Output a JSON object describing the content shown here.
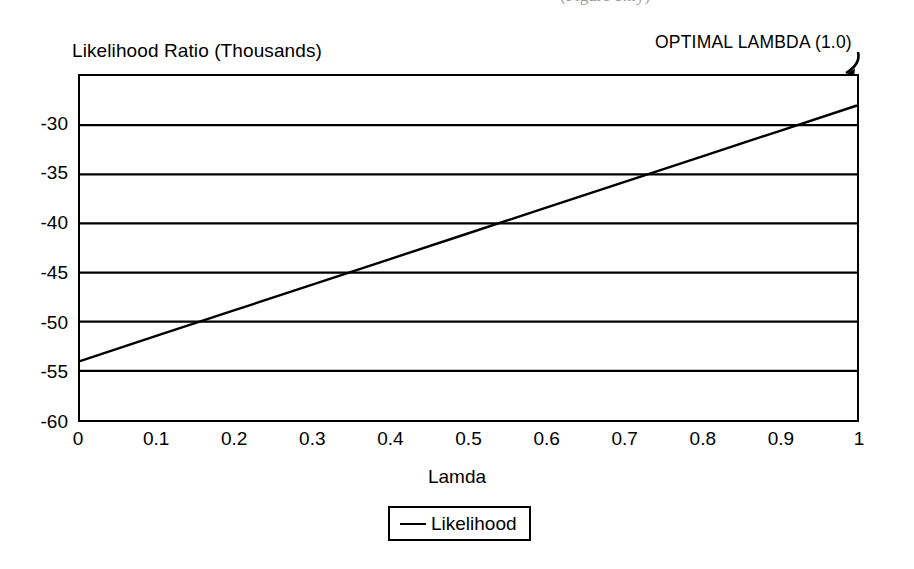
{
  "page": {
    "clipped_header_fragment": "(Figure only)"
  },
  "chart_data": {
    "type": "line",
    "title": "",
    "xlabel": "Lamda",
    "ylabel": "Likelihood Ratio (Thousands)",
    "xlim": [
      0,
      1
    ],
    "ylim": [
      -60,
      -25
    ],
    "grid": "horizontal",
    "legend_position": "bottom",
    "x_ticks": [
      "0",
      "0.1",
      "0.2",
      "0.3",
      "0.4",
      "0.5",
      "0.6",
      "0.7",
      "0.8",
      "0.9",
      "1"
    ],
    "x_tick_values": [
      0,
      0.1,
      0.2,
      0.3,
      0.4,
      0.5,
      0.6,
      0.7,
      0.8,
      0.9,
      1
    ],
    "y_ticks": [
      "-30",
      "-35",
      "-40",
      "-45",
      "-50",
      "-55",
      "-60"
    ],
    "y_tick_values": [
      -30,
      -35,
      -40,
      -45,
      -50,
      -55,
      -60
    ],
    "series": [
      {
        "name": "Likelihood",
        "color": "#000000",
        "x": [
          0,
          0.1,
          0.2,
          0.3,
          0.4,
          0.5,
          0.6,
          0.7,
          0.8,
          0.9,
          1
        ],
        "values": [
          -54.0,
          -51.4,
          -48.8,
          -46.2,
          -43.6,
          -41.0,
          -38.4,
          -35.8,
          -33.2,
          -30.6,
          -28.0
        ]
      }
    ],
    "legend": [
      {
        "label": "Likelihood",
        "marker": "line",
        "color": "#000000"
      }
    ],
    "annotations": [
      {
        "text": "OPTIMAL LAMBDA (1.0)",
        "points_to_x": 1,
        "points_to_y": -28.0
      }
    ]
  }
}
